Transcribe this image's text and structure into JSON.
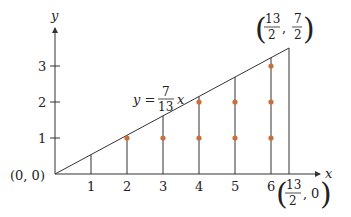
{
  "diagram": {
    "axes": {
      "x_label": "x",
      "y_label": "y",
      "x_ticks": [
        "1",
        "2",
        "3",
        "4",
        "5",
        "6"
      ],
      "y_ticks": [
        "1",
        "2",
        "3"
      ]
    },
    "origin_label": "(0, 0)",
    "line_label": {
      "lhs": "y =",
      "numerator": "7",
      "denominator": "13",
      "var": "x"
    },
    "top_corner_label": {
      "x_num": "13",
      "x_den": "2",
      "y_num": "7",
      "y_den": "2",
      "comma": ","
    },
    "bottom_corner_label": {
      "x_num": "13",
      "x_den": "2",
      "y_val": "0",
      "comma": ","
    },
    "lattice_points": [
      [
        2,
        1
      ],
      [
        3,
        1
      ],
      [
        4,
        1
      ],
      [
        4,
        2
      ],
      [
        5,
        1
      ],
      [
        5,
        2
      ],
      [
        6,
        1
      ],
      [
        6,
        2
      ],
      [
        6,
        3
      ]
    ],
    "colors": {
      "line": "#333333",
      "dot": "#c8703a"
    }
  }
}
